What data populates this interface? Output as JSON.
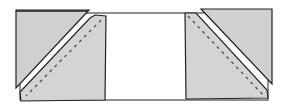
{
  "diagram": {
    "type": "quilt-block-flying-geese-step",
    "colors": {
      "background_rect": "#ffffff",
      "square_fill": "#d4d4d4",
      "triangle_fill": "#d0d0d0",
      "outline": "#222222",
      "stitch_line": "#555555"
    },
    "elements": [
      {
        "id": "background-rectangle",
        "desc": "white rectangle base"
      },
      {
        "id": "left-square",
        "desc": "gray square with dashed stitch line"
      },
      {
        "id": "left-folded-triangle",
        "desc": "triangle flipped toward top-left corner"
      },
      {
        "id": "right-square",
        "desc": "gray square with dashed stitch line"
      },
      {
        "id": "right-folded-triangle",
        "desc": "triangle flipped toward top-right corner"
      }
    ]
  }
}
